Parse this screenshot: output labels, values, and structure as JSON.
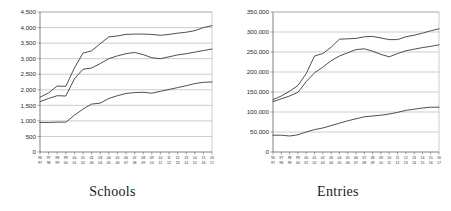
{
  "figure": {
    "panels": [
      "schools",
      "entries"
    ]
  },
  "chart_data": [
    {
      "type": "line",
      "title": "Schools",
      "xlabel": "",
      "ylabel": "",
      "ylim": [
        0,
        4500
      ],
      "ytick_labels": [
        "0",
        "500",
        "1,000",
        "1,500",
        "2,000",
        "2,500",
        "3,000",
        "3,500",
        "4,000",
        "4,500"
      ],
      "ytick_values": [
        0,
        500,
        1000,
        1500,
        2000,
        2500,
        3000,
        3500,
        4000,
        4500
      ],
      "grid": true,
      "legend": "none",
      "categories": [
        "96/97",
        "97/98",
        "98/99",
        "99/00",
        "00/01",
        "01/02",
        "02/03",
        "03/04",
        "04/05",
        "05/06",
        "06/07",
        "07/08",
        "08/09",
        "09/10",
        "10/11",
        "11/12",
        "12/13",
        "13/14",
        "14/15",
        "15/16",
        "16/17"
      ],
      "series": [
        {
          "name": "upper",
          "values": [
            1760,
            1900,
            2120,
            2110,
            2700,
            3180,
            3250,
            3480,
            3700,
            3730,
            3780,
            3790,
            3790,
            3780,
            3750,
            3780,
            3820,
            3850,
            3900,
            4000,
            4060
          ]
        },
        {
          "name": "middle",
          "values": [
            1620,
            1720,
            1810,
            1800,
            2350,
            2660,
            2700,
            2840,
            3000,
            3090,
            3160,
            3200,
            3130,
            3030,
            3000,
            3060,
            3120,
            3160,
            3210,
            3260,
            3310
          ]
        },
        {
          "name": "lower",
          "values": [
            950,
            950,
            960,
            960,
            1180,
            1380,
            1540,
            1570,
            1720,
            1810,
            1880,
            1910,
            1920,
            1890,
            1950,
            2010,
            2070,
            2130,
            2200,
            2240,
            2250
          ]
        }
      ]
    },
    {
      "type": "line",
      "title": "Entries",
      "xlabel": "",
      "ylabel": "",
      "ylim": [
        0,
        350000
      ],
      "ytick_labels": [
        "0",
        "50,000",
        "100,000",
        "150,000",
        "200,000",
        "250,000",
        "300,000",
        "350,000"
      ],
      "ytick_values": [
        0,
        50000,
        100000,
        150000,
        200000,
        250000,
        300000,
        350000
      ],
      "grid": true,
      "legend": "none",
      "categories": [
        "96/97",
        "97/98",
        "98/99",
        "99/00",
        "00/01",
        "01/02",
        "02/03",
        "03/04",
        "04/05",
        "05/06",
        "06/07",
        "07/08",
        "08/09",
        "09/10",
        "10/11",
        "11/12",
        "12/13",
        "13/14",
        "14/15",
        "15/16",
        "16/17"
      ],
      "series": [
        {
          "name": "upper",
          "values": [
            131000,
            140000,
            152000,
            166000,
            196000,
            240000,
            246000,
            262000,
            282000,
            283000,
            284000,
            288000,
            289000,
            285000,
            281000,
            281000,
            288000,
            292000,
            297000,
            303000,
            308000
          ]
        },
        {
          "name": "middle",
          "values": [
            126000,
            133000,
            140000,
            149000,
            176000,
            198000,
            212000,
            228000,
            240000,
            248000,
            256000,
            258000,
            252000,
            244000,
            238000,
            246000,
            253000,
            257000,
            261000,
            264000,
            268000
          ]
        },
        {
          "name": "lower",
          "values": [
            42000,
            42000,
            40000,
            43000,
            50000,
            56000,
            60000,
            66000,
            72000,
            78000,
            83000,
            88000,
            90000,
            92000,
            95000,
            99000,
            104000,
            107000,
            110000,
            112000,
            112000
          ]
        }
      ]
    }
  ]
}
